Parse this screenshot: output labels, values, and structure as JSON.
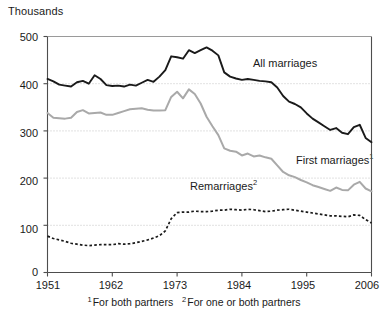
{
  "chart_data": {
    "type": "line",
    "title": "",
    "ylabel": "Thousands",
    "xlabel": "",
    "ylim": [
      0,
      500
    ],
    "xlim": [
      1951,
      2006
    ],
    "yticks": [
      0,
      100,
      200,
      300,
      400,
      500
    ],
    "ytick_labels": [
      "0",
      "100",
      "200",
      "300",
      "400",
      "500"
    ],
    "xticks": [
      1951,
      1962,
      1973,
      1984,
      1995,
      2006
    ],
    "xtick_labels": [
      "1951",
      "1962",
      "1973",
      "1984",
      "1995",
      "2006"
    ],
    "grid": "horizontal dotted at 100, 200, 300, 400",
    "legend_position": "inline annotations on plot",
    "x": [
      1951,
      1952,
      1953,
      1954,
      1955,
      1956,
      1957,
      1958,
      1959,
      1960,
      1961,
      1962,
      1963,
      1964,
      1965,
      1966,
      1967,
      1968,
      1969,
      1970,
      1971,
      1972,
      1973,
      1974,
      1975,
      1976,
      1977,
      1978,
      1979,
      1980,
      1981,
      1982,
      1983,
      1984,
      1985,
      1986,
      1987,
      1988,
      1989,
      1990,
      1991,
      1992,
      1993,
      1994,
      1995,
      1996,
      1997,
      1998,
      1999,
      2000,
      2001,
      2002,
      2003,
      2004,
      2005,
      2006
    ],
    "series": [
      {
        "name": "All marriages",
        "style": "solid",
        "color": "#1a1a1a",
        "label": "All marriages",
        "label_x": 1990,
        "label_y": 440,
        "values": [
          410,
          405,
          398,
          396,
          394,
          403,
          406,
          400,
          418,
          410,
          397,
          395,
          396,
          394,
          398,
          396,
          402,
          408,
          404,
          415,
          429,
          458,
          456,
          453,
          471,
          465,
          471,
          477,
          470,
          460,
          424,
          415,
          411,
          408,
          410,
          408,
          406,
          405,
          403,
          392,
          374,
          362,
          357,
          350,
          337,
          326,
          318,
          310,
          302,
          306,
          296,
          293,
          308,
          313,
          285,
          276
        ]
      },
      {
        "name": "First marriages",
        "style": "solid",
        "color": "#a9a9a9",
        "label": "First marriages",
        "label_superscript": "1",
        "label_x": 1993,
        "label_y": 215,
        "values": [
          338,
          328,
          327,
          326,
          328,
          340,
          344,
          337,
          338,
          339,
          334,
          334,
          338,
          342,
          346,
          347,
          348,
          345,
          343,
          343,
          344,
          372,
          383,
          369,
          388,
          378,
          358,
          330,
          310,
          291,
          263,
          258,
          256,
          248,
          252,
          246,
          248,
          244,
          241,
          227,
          213,
          206,
          202,
          196,
          191,
          185,
          181,
          177,
          173,
          180,
          175,
          174,
          186,
          192,
          178,
          172
        ]
      },
      {
        "name": "Remarriages",
        "style": "dashed",
        "color": "#1a1a1a",
        "label": "Remarriages",
        "label_superscript": "2",
        "label_x": 1979,
        "label_y": 155,
        "values": [
          77,
          72,
          69,
          66,
          62,
          60,
          58,
          57,
          58,
          59,
          59,
          59,
          61,
          60,
          61,
          63,
          66,
          69,
          73,
          78,
          88,
          114,
          127,
          128,
          128,
          130,
          129,
          129,
          130,
          132,
          132,
          134,
          133,
          132,
          134,
          133,
          131,
          129,
          130,
          132,
          133,
          134,
          132,
          130,
          128,
          126,
          124,
          122,
          120,
          120,
          119,
          118,
          122,
          121,
          112,
          105
        ]
      }
    ],
    "footnotes": [
      {
        "marker": "1",
        "text": "For both partners"
      },
      {
        "marker": "2",
        "text": "For one or both partners"
      }
    ]
  }
}
